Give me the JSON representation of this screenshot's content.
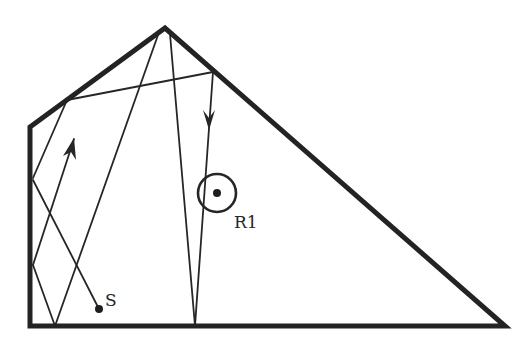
{
  "diagram": {
    "type": "ray-tracing-room",
    "colors": {
      "wall": "#232323",
      "ray": "#262626",
      "background": "#ffffff"
    },
    "room": {
      "vertices": [
        [
          30,
          127
        ],
        [
          165,
          28
        ],
        [
          505,
          326
        ],
        [
          30,
          326
        ]
      ]
    },
    "source": {
      "label": "S",
      "position": [
        99,
        309
      ]
    },
    "receiver": {
      "label": "R1",
      "position": [
        217,
        193
      ],
      "radius": 19
    },
    "rays": [
      {
        "name": "ray-source-to-left-wall",
        "from": [
          99,
          309
        ],
        "to": [
          33,
          180
        ]
      },
      {
        "name": "ray-left-wall-upper-return",
        "from": [
          33,
          178
        ],
        "to": [
          67,
          100
        ]
      },
      {
        "name": "ray-top-edge-crossing",
        "from": [
          67,
          100
        ],
        "to": [
          213,
          72
        ]
      },
      {
        "name": "ray-right-edge-down",
        "from": [
          213,
          72
        ],
        "to": [
          195,
          326
        ]
      },
      {
        "name": "ray-bottom-to-apex-right",
        "from": [
          195,
          326
        ],
        "to": [
          170,
          34
        ]
      },
      {
        "name": "ray-apex-to-bottom-left",
        "from": [
          158,
          35
        ],
        "to": [
          55,
          326
        ]
      },
      {
        "name": "ray-bottom-to-left-wall",
        "from": [
          55,
          326
        ],
        "to": [
          33,
          265
        ]
      },
      {
        "name": "ray-left-wall-to-arrow",
        "from": [
          33,
          265
        ],
        "to": [
          74,
          139
        ]
      }
    ],
    "arrows": [
      {
        "name": "arrow-up-right",
        "tip": [
          74,
          138
        ],
        "direction": "up"
      },
      {
        "name": "arrow-down",
        "tip": [
          209,
          130
        ],
        "direction": "down"
      }
    ]
  }
}
